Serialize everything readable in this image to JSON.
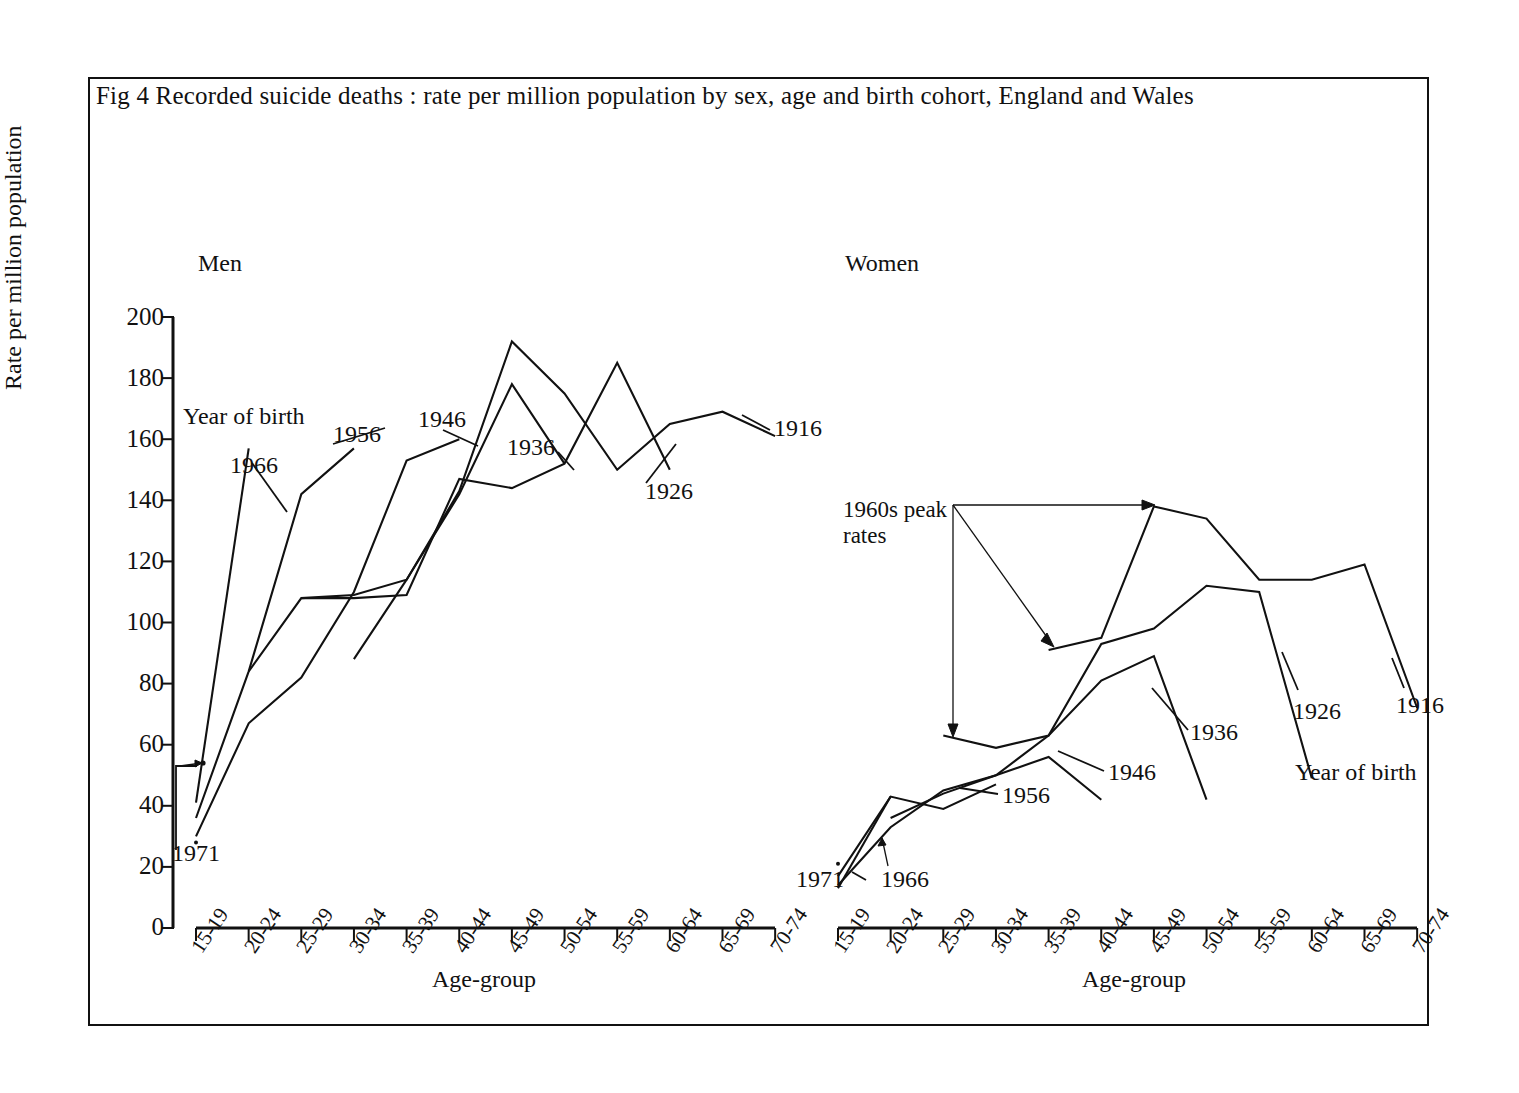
{
  "figure": {
    "title": "Fig 4   Recorded suicide deaths : rate per million population by sex, age and birth cohort,  England and Wales",
    "panels": [
      {
        "id": "men",
        "title": "Men"
      },
      {
        "id": "women",
        "title": "Women"
      }
    ],
    "axis": {
      "y_label": "Rate per million population",
      "x_label": "Age-group",
      "y_ticks": [
        "0",
        "20",
        "40",
        "60",
        "80",
        "100",
        "120",
        "140",
        "160",
        "180",
        "200"
      ],
      "x_ticks": [
        "15-19",
        "20-24",
        "25-29",
        "30-34",
        "35-39",
        "40-44",
        "45-49",
        "50-54",
        "55-59",
        "60-64",
        "65-69",
        "70-74"
      ]
    },
    "legend_caption": "Year of birth",
    "annotations": {
      "peak_rates": "1960s peak\nrates"
    },
    "cohort_labels": {
      "c1916": "1916",
      "c1926": "1926",
      "c1936": "1936",
      "c1946": "1946",
      "c1956": "1956",
      "c1966": "1966",
      "c1971": "1971"
    }
  },
  "chart_data": [
    {
      "type": "line",
      "title": "Men",
      "xlabel": "Age-group",
      "ylabel": "Rate per million population",
      "ylim": [
        0,
        200
      ],
      "grid": false,
      "legend": "Year of birth",
      "categories": [
        "15-19",
        "20-24",
        "25-29",
        "30-34",
        "35-39",
        "40-44",
        "45-49",
        "50-54",
        "55-59",
        "60-64",
        "65-69",
        "70-74"
      ],
      "series": [
        {
          "name": "1971",
          "x": [
            "15-19"
          ],
          "values": [
            28
          ]
        },
        {
          "name": "1966",
          "x": [
            "15-19",
            "20-24"
          ],
          "values": [
            41,
            157
          ]
        },
        {
          "name": "1956",
          "x": [
            "15-19",
            "20-24",
            "25-29",
            "30-34"
          ],
          "values": [
            36,
            84,
            142,
            157
          ]
        },
        {
          "name": "1946",
          "x": [
            "15-19",
            "20-24",
            "25-29",
            "30-34",
            "35-39",
            "40-44"
          ],
          "values": [
            30,
            67,
            82,
            110,
            153,
            160
          ]
        },
        {
          "name": "1936",
          "x": [
            "20-24",
            "25-29",
            "30-34",
            "35-39",
            "40-44",
            "45-49",
            "50-54"
          ],
          "values": [
            84,
            108,
            109,
            114,
            142,
            178,
            152
          ]
        },
        {
          "name": "1926",
          "x": [
            "25-29",
            "30-34",
            "35-39",
            "40-44",
            "45-49",
            "50-54",
            "55-59",
            "60-64"
          ],
          "values": [
            108,
            108,
            109,
            147,
            144,
            152,
            185,
            150
          ]
        },
        {
          "name": "1916",
          "x": [
            "30-34",
            "35-39",
            "40-44",
            "45-49",
            "50-54",
            "55-59",
            "60-64",
            "65-69",
            "70-74"
          ],
          "values": [
            88,
            114,
            143,
            192,
            175,
            150,
            165,
            169,
            161
          ]
        }
      ]
    },
    {
      "type": "line",
      "title": "Women",
      "xlabel": "Age-group",
      "ylabel": "Rate per million population",
      "ylim": [
        0,
        200
      ],
      "grid": false,
      "legend": "Year of birth",
      "categories": [
        "15-19",
        "20-24",
        "25-29",
        "30-34",
        "35-39",
        "40-44",
        "45-49",
        "50-54",
        "55-59",
        "60-64",
        "65-69",
        "70-74"
      ],
      "series": [
        {
          "name": "1971",
          "x": [
            "15-19"
          ],
          "values": [
            21
          ]
        },
        {
          "name": "1966",
          "x": [
            "15-19",
            "20-24"
          ],
          "values": [
            13,
            43
          ]
        },
        {
          "name": "1956",
          "x": [
            "15-19",
            "20-24",
            "25-29",
            "30-34"
          ],
          "values": [
            17,
            43,
            39,
            47
          ]
        },
        {
          "name": "1946",
          "x": [
            "15-19",
            "20-24",
            "25-29",
            "30-34",
            "35-39",
            "40-44"
          ],
          "values": [
            14,
            33,
            45,
            50,
            56,
            42
          ]
        },
        {
          "name": "1936",
          "x": [
            "20-24",
            "25-29",
            "30-34",
            "35-39",
            "40-44",
            "45-49",
            "50-54"
          ],
          "values": [
            36,
            44,
            50,
            63,
            81,
            89,
            42
          ]
        },
        {
          "name": "1926",
          "x": [
            "25-29",
            "30-34",
            "35-39",
            "40-44",
            "45-49",
            "50-54",
            "55-59",
            "60-64"
          ],
          "values": [
            63,
            59,
            63,
            93,
            98,
            112,
            110,
            49
          ]
        },
        {
          "name": "1916",
          "x": [
            "35-39",
            "40-44",
            "45-49",
            "50-54",
            "55-59",
            "60-64",
            "65-69",
            "70-74"
          ],
          "values": [
            91,
            95,
            138,
            134,
            114,
            114,
            119,
            72
          ]
        }
      ]
    }
  ]
}
